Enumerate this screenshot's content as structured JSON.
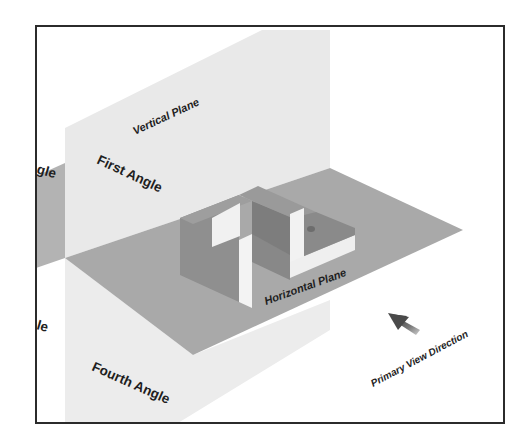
{
  "diagram": {
    "colors": {
      "background": "#ffffff",
      "frame": "#2b2b2b",
      "vertical_plane": "#e9e9e9",
      "vertical_plane_lower": "#ececec",
      "horizontal_plane": "#a9a9a9",
      "back_plane": "#b3b3b3",
      "object_front": "#8f8f8f",
      "object_side": "#9c9c9c",
      "object_top": "#f2f2f2",
      "object_inner": "#7d7d7d",
      "arrow": "#6e6e6e",
      "text": "#1e1e1e"
    },
    "labels": {
      "vertical_plane": "Vertical Plane",
      "horizontal_plane": "Horizontal Plane",
      "first_angle": "First Angle",
      "fourth_angle": "Fourth Angle",
      "second_angle_partial": "gle",
      "third_angle_partial": "le",
      "primary_view_direction": "Primary View Direction"
    },
    "icons": {
      "view_arrow": "arrow-up-left"
    }
  }
}
